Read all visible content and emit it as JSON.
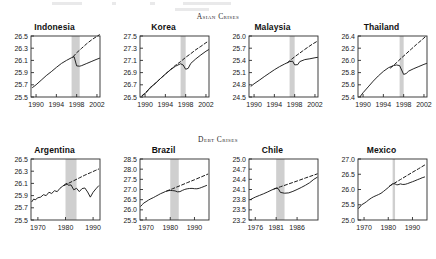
{
  "figure": {
    "sections": [
      {
        "id": "asian",
        "label": "Asian Crises"
      },
      {
        "id": "debt",
        "label": "Debt Crises"
      }
    ]
  },
  "chart_data": [
    {
      "type": "line",
      "title": "Indonesia",
      "xlabel": "",
      "ylabel": "",
      "xlim": [
        1989,
        2002.6
      ],
      "ylim": [
        25.5,
        26.5
      ],
      "xticks": [
        1990,
        1994,
        1998,
        2002
      ],
      "yticks": [
        25.5,
        25.7,
        25.9,
        26.1,
        26.3,
        26.5
      ],
      "grid": false,
      "legend": "none",
      "crisis_band": [
        1997.0,
        1998.6
      ],
      "series": [
        {
          "name": "actual",
          "style": "solid",
          "x": [
            1989.3,
            1990,
            1991,
            1992,
            1993,
            1994,
            1995,
            1996,
            1997,
            1997.5,
            1998,
            1998.6,
            1999,
            2000,
            2001,
            2002,
            2002.5
          ],
          "values": [
            25.655,
            25.7,
            25.775,
            25.85,
            25.915,
            25.985,
            26.05,
            26.1,
            26.145,
            26.16,
            26.01,
            26.005,
            26.015,
            26.05,
            26.085,
            26.12,
            26.135
          ]
        },
        {
          "name": "counterfactual-trend",
          "style": "dashed",
          "x": [
            1997.3,
            1998,
            1999,
            2000,
            2001,
            2002,
            2002.5
          ],
          "values": [
            26.16,
            26.225,
            26.3,
            26.375,
            26.44,
            26.495,
            26.52
          ]
        }
      ]
    },
    {
      "type": "line",
      "title": "Korea",
      "xlabel": "",
      "ylabel": "",
      "xlim": [
        1989,
        2002.6
      ],
      "ylim": [
        26.5,
        27.5
      ],
      "xticks": [
        1990,
        1994,
        1998,
        2002
      ],
      "yticks": [
        26.5,
        26.7,
        26.9,
        27.1,
        27.3,
        27.5
      ],
      "grid": false,
      "legend": "none",
      "crisis_band": [
        1997.0,
        1998.0
      ],
      "series": [
        {
          "name": "actual",
          "style": "solid",
          "x": [
            1989.4,
            1990,
            1990.5,
            1991,
            1992,
            1993,
            1994,
            1995,
            1996,
            1997,
            1997.5,
            1998,
            1998.5,
            1999,
            2000,
            2001,
            2002,
            2002.5
          ],
          "values": [
            26.52,
            26.555,
            26.6,
            26.655,
            26.72,
            26.8,
            26.875,
            26.945,
            27.005,
            27.045,
            27.025,
            26.955,
            26.97,
            27.05,
            27.125,
            27.19,
            27.25,
            27.275
          ]
        },
        {
          "name": "counterfactual-trend",
          "style": "dashed",
          "x": [
            1989.4,
            1990,
            1991,
            1992,
            1993,
            1994,
            1995,
            1996,
            1997,
            1998,
            1999,
            2000,
            2001,
            2002,
            2002.5
          ],
          "values": [
            26.52,
            26.565,
            26.645,
            26.725,
            26.8,
            26.875,
            26.95,
            27.02,
            27.08,
            27.15,
            27.21,
            27.275,
            27.33,
            27.39,
            27.415
          ]
        }
      ]
    },
    {
      "type": "line",
      "title": "Malaysia",
      "xlabel": "",
      "ylabel": "",
      "xlim": [
        1989,
        2002.6
      ],
      "ylim": [
        24.5,
        26.0
      ],
      "xticks": [
        1990,
        1994,
        1998,
        2002
      ],
      "yticks": [
        24.5,
        24.8,
        25.1,
        25.4,
        25.7,
        26.0
      ],
      "grid": false,
      "legend": "none",
      "crisis_band": [
        1997.0,
        1998.0
      ],
      "series": [
        {
          "name": "actual",
          "style": "solid",
          "x": [
            1989.4,
            1990,
            1991,
            1992,
            1993,
            1994,
            1995,
            1996,
            1997,
            1997.6,
            1998,
            1998.6,
            1999,
            2000,
            2001,
            2002,
            2002.5
          ],
          "values": [
            24.765,
            24.825,
            24.91,
            25.0,
            25.085,
            25.17,
            25.245,
            25.31,
            25.37,
            25.38,
            25.29,
            25.295,
            25.37,
            25.42,
            25.44,
            25.465,
            25.475
          ]
        },
        {
          "name": "counterfactual-trend",
          "style": "dashed",
          "x": [
            1996.6,
            1997.5,
            1998.5,
            1999.5,
            2000.5,
            2001.5,
            2002.5
          ],
          "values": [
            25.345,
            25.44,
            25.535,
            25.625,
            25.715,
            25.8,
            25.875
          ]
        }
      ]
    },
    {
      "type": "line",
      "title": "Thailand",
      "xlabel": "",
      "ylabel": "",
      "xlim": [
        1989,
        2002.6
      ],
      "ylim": [
        25.4,
        26.4
      ],
      "xticks": [
        1990,
        1994,
        1998,
        2002
      ],
      "yticks": [
        25.4,
        25.6,
        25.8,
        26.0,
        26.2,
        26.4
      ],
      "grid": false,
      "legend": "none",
      "crisis_band": [
        1997.2,
        1998.0
      ],
      "series": [
        {
          "name": "actual",
          "style": "solid",
          "x": [
            1989.4,
            1990,
            1991,
            1992,
            1993,
            1994,
            1995,
            1996,
            1996.6,
            1997.2,
            1998,
            1998.5,
            1999,
            2000,
            2001,
            2002,
            2002.5
          ],
          "values": [
            25.405,
            25.47,
            25.565,
            25.66,
            25.745,
            25.82,
            25.88,
            25.915,
            25.925,
            25.915,
            25.77,
            25.785,
            25.825,
            25.865,
            25.9,
            25.935,
            25.95
          ]
        },
        {
          "name": "counterfactual-trend",
          "style": "dashed",
          "x": [
            1995.4,
            1996.5,
            1997.5,
            1998.5,
            1999.5,
            2000.5,
            2001.5,
            2002.5
          ],
          "values": [
            25.875,
            25.955,
            26.035,
            26.11,
            26.185,
            26.26,
            26.33,
            26.405
          ]
        }
      ]
    },
    {
      "type": "line",
      "title": "Argentina",
      "xlabel": "",
      "ylabel": "",
      "xlim": [
        1967.5,
        1992.5
      ],
      "ylim": [
        25.5,
        26.5
      ],
      "xticks": [
        1970,
        1980,
        1990
      ],
      "yticks": [
        25.5,
        25.7,
        25.9,
        26.1,
        26.3,
        26.5
      ],
      "grid": false,
      "legend": "none",
      "crisis_band": [
        1980.0,
        1984.0
      ],
      "series": [
        {
          "name": "actual",
          "style": "solid",
          "x": [
            1967.8,
            1968.5,
            1969,
            1970,
            1971,
            1972,
            1973,
            1974,
            1975,
            1976,
            1977,
            1978,
            1979,
            1980,
            1980.5,
            1981,
            1982,
            1983,
            1984,
            1985,
            1986,
            1987,
            1988,
            1989,
            1990,
            1991,
            1992
          ],
          "values": [
            25.8,
            25.845,
            25.83,
            25.865,
            25.875,
            25.915,
            25.9,
            25.955,
            25.935,
            25.98,
            25.965,
            26.02,
            26.055,
            26.09,
            26.1,
            26.07,
            26.075,
            25.995,
            26.02,
            25.965,
            26.015,
            26.025,
            25.96,
            25.875,
            25.955,
            26.01,
            26.06
          ]
        },
        {
          "name": "counterfactual-trend",
          "style": "dashed",
          "x": [
            1979.5,
            1981,
            1983,
            1985,
            1987,
            1989,
            1991,
            1992
          ],
          "values": [
            26.065,
            26.1,
            26.145,
            26.19,
            26.235,
            26.275,
            26.315,
            26.335
          ]
        }
      ]
    },
    {
      "type": "line",
      "title": "Brazil",
      "xlabel": "",
      "ylabel": "",
      "xlim": [
        1967.5,
        1996
      ],
      "ylim": [
        25.5,
        28.5
      ],
      "xticks": [
        1970,
        1980,
        1990
      ],
      "yticks": [
        25.5,
        26.0,
        26.5,
        27.0,
        27.5,
        28.0,
        28.5
      ],
      "grid": false,
      "legend": "none",
      "crisis_band": [
        1980.0,
        1983.5
      ],
      "series": [
        {
          "name": "actual",
          "style": "solid",
          "x": [
            1967.8,
            1968.5,
            1969,
            1970,
            1971,
            1972,
            1973,
            1974,
            1975,
            1976,
            1977,
            1978,
            1979,
            1980,
            1981,
            1982,
            1983,
            1984,
            1985,
            1986,
            1987,
            1988,
            1989,
            1990,
            1991,
            1992,
            1993,
            1994,
            1995
          ],
          "values": [
            26.175,
            26.26,
            26.33,
            26.4,
            26.48,
            26.545,
            26.6,
            26.665,
            26.73,
            26.795,
            26.845,
            26.9,
            26.935,
            26.955,
            26.945,
            26.93,
            26.885,
            26.895,
            26.955,
            27.005,
            27.035,
            27.05,
            27.055,
            27.04,
            27.035,
            27.06,
            27.105,
            27.15,
            27.2
          ]
        },
        {
          "name": "counterfactual-trend",
          "style": "dashed",
          "x": [
            1978.5,
            1981,
            1984,
            1987,
            1990,
            1993,
            1995.5
          ],
          "values": [
            26.925,
            27.04,
            27.185,
            27.335,
            27.48,
            27.63,
            27.755
          ]
        }
      ]
    },
    {
      "type": "line",
      "title": "Chile",
      "xlabel": "",
      "ylabel": "",
      "xlim": [
        1974.5,
        1991
      ],
      "ylim": [
        23.2,
        25.0
      ],
      "xticks": [
        1976,
        1981,
        1986
      ],
      "yticks": [
        23.2,
        23.5,
        23.8,
        24.1,
        24.4,
        24.7,
        25.0
      ],
      "grid": false,
      "legend": "none",
      "crisis_band": [
        1981.0,
        1983.0
      ],
      "series": [
        {
          "name": "actual",
          "style": "solid",
          "x": [
            1974.8,
            1975.5,
            1976,
            1977,
            1978,
            1979,
            1980,
            1981,
            1981.5,
            1982,
            1983,
            1984,
            1985,
            1986,
            1987,
            1988,
            1989,
            1990,
            1990.8
          ],
          "values": [
            23.8,
            23.845,
            23.875,
            23.925,
            23.975,
            24.03,
            24.09,
            24.135,
            24.125,
            24.015,
            23.99,
            24.0,
            24.045,
            24.1,
            24.16,
            24.225,
            24.3,
            24.4,
            24.46
          ]
        },
        {
          "name": "counterfactual-trend",
          "style": "dashed",
          "x": [
            1980.5,
            1982,
            1984,
            1986,
            1988,
            1990,
            1990.8
          ],
          "values": [
            24.12,
            24.18,
            24.265,
            24.35,
            24.44,
            24.525,
            24.56
          ]
        }
      ]
    },
    {
      "type": "line",
      "title": "Mexico",
      "xlabel": "",
      "ylabel": "",
      "xlim": [
        1967.5,
        1996
      ],
      "ylim": [
        25.0,
        27.0
      ],
      "xticks": [
        1970,
        1980,
        1990
      ],
      "yticks": [
        25.0,
        25.5,
        26.0,
        26.5,
        27.0
      ],
      "grid": false,
      "legend": "none",
      "crisis_band": [
        1981.8,
        1982.8
      ],
      "series": [
        {
          "name": "actual",
          "style": "solid",
          "x": [
            1967.8,
            1969,
            1970,
            1971,
            1972,
            1973,
            1974,
            1975,
            1976,
            1977,
            1978,
            1979,
            1980,
            1981,
            1981.8,
            1982.8,
            1983.5,
            1984,
            1985,
            1986,
            1987,
            1988,
            1989,
            1990,
            1991,
            1992,
            1993,
            1994,
            1995
          ],
          "values": [
            25.385,
            25.5,
            25.545,
            25.6,
            25.665,
            25.72,
            25.765,
            25.8,
            25.835,
            25.875,
            25.935,
            26.0,
            26.065,
            26.14,
            26.19,
            26.185,
            26.155,
            26.155,
            26.185,
            26.165,
            26.17,
            26.195,
            26.225,
            26.255,
            26.285,
            26.32,
            26.35,
            26.385,
            26.41
          ]
        },
        {
          "name": "counterfactual-trend",
          "style": "dashed",
          "x": [
            1980.5,
            1982.5,
            1985,
            1987.5,
            1990,
            1992.5,
            1995
          ],
          "values": [
            26.11,
            26.205,
            26.325,
            26.445,
            26.565,
            26.68,
            26.8
          ]
        }
      ]
    }
  ],
  "style": {
    "band_color": "#cfcfcf",
    "line_color": "#1a1a1a",
    "axis_color": "#2b2b2b"
  }
}
